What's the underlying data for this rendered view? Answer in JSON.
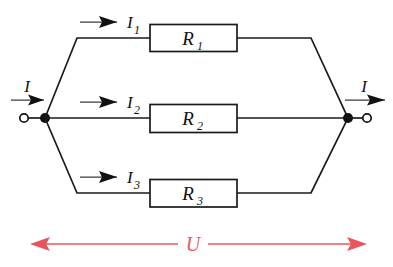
{
  "diagram": {
    "type": "electrical-schematic",
    "background_color": "#ffffff",
    "wire_color": "#1a1a1a",
    "accent_color": "#e8545a"
  },
  "terminals": {
    "left": {
      "current_label": "I",
      "node_x": 45,
      "node_y": 118
    },
    "right": {
      "current_label": "I",
      "node_x": 348,
      "node_y": 118
    }
  },
  "branches": [
    {
      "current_label": "I",
      "current_sub": "1",
      "resistor_label": "R",
      "resistor_sub": "1",
      "y": 38
    },
    {
      "current_label": "I",
      "current_sub": "2",
      "resistor_label": "R",
      "resistor_sub": "2",
      "y": 118
    },
    {
      "current_label": "I",
      "current_sub": "3",
      "resistor_label": "R",
      "resistor_sub": "3",
      "y": 193
    }
  ],
  "voltage": {
    "label": "U",
    "color": "#e8545a",
    "y": 244
  }
}
